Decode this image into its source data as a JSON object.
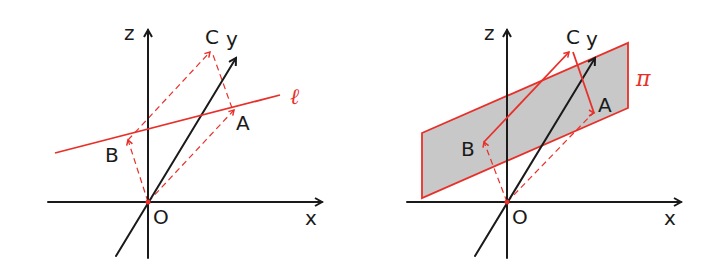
{
  "colors": {
    "axis": "#1a1a1a",
    "accent": "#e8302a",
    "plane_fill": "#c8c8c8"
  },
  "left_panel": {
    "axes": {
      "z_label": "z",
      "y_label": "y",
      "x_label": "x",
      "origin_label": "O"
    },
    "points": {
      "a_label": "A",
      "b_label": "B",
      "c_label": "C"
    },
    "line_label": "ℓ"
  },
  "right_panel": {
    "axes": {
      "z_label": "z",
      "y_label": "y",
      "x_label": "x",
      "origin_label": "O"
    },
    "points": {
      "a_label": "A",
      "b_label": "B",
      "c_label": "C"
    },
    "plane_label": "π"
  }
}
